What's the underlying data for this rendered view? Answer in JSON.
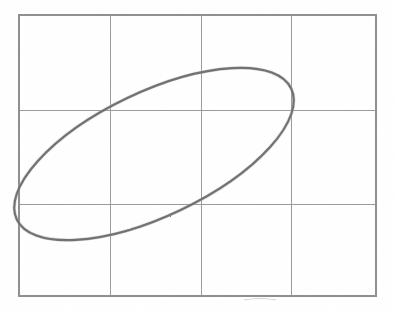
{
  "figure": {
    "kind": "scatter",
    "background_color": "#ffffff",
    "grid_line_color": "#9a9a9a",
    "grid_border_color": "#8e8e8e",
    "trace_color": "#6f6f6f"
  },
  "chart_data": {
    "type": "scatter",
    "title": "",
    "subtitle": "",
    "xlabel": "",
    "ylabel": "",
    "grid": true,
    "legend": "none",
    "annotations": [],
    "xlim": [
      0,
      4
    ],
    "ylim": [
      0,
      3
    ],
    "xticklabels": [],
    "yticklabels": [],
    "grid_columns": 4,
    "grid_rows": 3,
    "grid_x_positions_px": [
      19,
      110,
      201,
      291,
      376
    ],
    "grid_y_positions_px": [
      15,
      110,
      204,
      296
    ],
    "plot_box_px": {
      "left": 19,
      "top": 15,
      "right": 376,
      "bottom": 296
    },
    "series": [
      {
        "name": "ellipse-trace",
        "shape": "ellipse",
        "closed": true,
        "center_px": [
          154,
          154
        ],
        "semi_major_px": 152,
        "semi_minor_px": 62,
        "rotation_deg": -25.5,
        "bounding_box_px": {
          "left": 18,
          "top": 69,
          "right": 291,
          "bottom": 238
        },
        "extreme_points_px": {
          "leftmost": [
            18,
            112
          ],
          "rightmost": [
            291,
            203
          ],
          "topmost": [
            106,
            69
          ],
          "bottommost": [
            201,
            238
          ]
        },
        "stroke_color": "#6f6f6f",
        "stroke_width_px": 2.1
      }
    ]
  },
  "artifacts": {
    "smudge_label": "faint scan smudge below lower border",
    "smudge_px": {
      "x": 244,
      "y": 299,
      "width": 32,
      "height": 3
    }
  }
}
